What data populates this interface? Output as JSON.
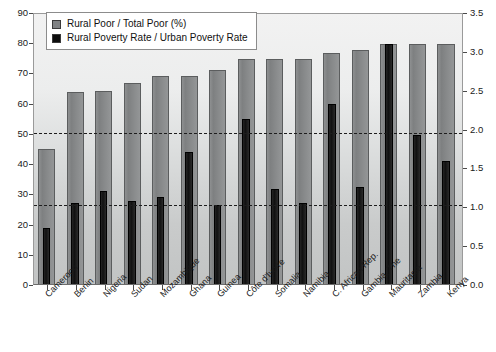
{
  "chart_data": {
    "type": "bar",
    "title": "",
    "subtitle": "",
    "xlabel": "",
    "ylabel": "",
    "grid": false,
    "legend_position": "top-left",
    "categories": [
      "Cameroon",
      "Benin",
      "Nigeria",
      "Sudan",
      "Mozambique",
      "Ghana",
      "Guinea",
      "Côte d'Ivoire",
      "Somalia",
      "Namibia",
      "C. African Rep.",
      "Gambia, The",
      "Mauritania",
      "Zambia",
      "Kenya"
    ],
    "series": [
      {
        "name": "Rural Poor / Total Poor (%)",
        "axis": "left",
        "color": "#808284",
        "values": [
          45,
          64,
          64.5,
          67,
          69.5,
          69.5,
          71.5,
          75,
          75,
          75,
          77,
          78,
          80,
          80,
          80
        ]
      },
      {
        "name": "Rural Poverty Rate / Urban Poverty Rate",
        "axis": "right",
        "color": "#0d0d0d",
        "values": [
          0.72,
          1.05,
          1.21,
          1.07,
          1.13,
          1.71,
          1.03,
          2.14,
          1.23,
          1.05,
          2.33,
          1.26,
          3.11,
          1.93,
          1.6
        ]
      }
    ],
    "left_axis": {
      "label": "",
      "min": 0,
      "max": 90,
      "step": 10,
      "ticks": [
        "0",
        "10",
        "20",
        "30",
        "40",
        "50",
        "60",
        "70",
        "80",
        "90"
      ]
    },
    "right_axis": {
      "label": "",
      "min": 0.0,
      "max": 3.5,
      "step": 0.5,
      "ticks": [
        "0.0",
        "0.5",
        "1.0",
        "1.5",
        "2.0",
        "2.5",
        "3.0",
        "3.5"
      ]
    },
    "reference_lines": [
      {
        "name": "upper-reference-line",
        "left_value": 50,
        "right_value": 2.0,
        "style": "dashed"
      },
      {
        "name": "lower-reference-line",
        "left_value": 26,
        "right_value": 1.0,
        "style": "dashed"
      }
    ]
  },
  "legend": {
    "items": [
      {
        "label": "Rural Poor / Total Poor (%)",
        "swatch": "gray"
      },
      {
        "label": "Rural Poverty Rate / Urban Poverty Rate",
        "swatch": "black"
      }
    ]
  }
}
